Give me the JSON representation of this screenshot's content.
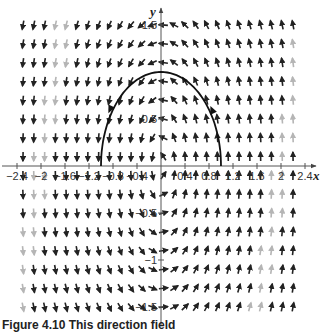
{
  "chart_data": {
    "type": "direction_field",
    "title": "",
    "xlabel": "x",
    "ylabel": "y",
    "xlim": [
      -2.6,
      2.6
    ],
    "ylim": [
      -1.6,
      1.6
    ],
    "x_ticks": [
      -2.4,
      -2,
      -1.6,
      -1.2,
      -0.8,
      -0.4,
      0.4,
      0.8,
      1.2,
      1.6,
      2,
      2.4
    ],
    "x_tick_labels": [
      "−2.4",
      "−2",
      "−1.6",
      "−1.2",
      "−0.8",
      "−0.4",
      "0.4",
      "0.8",
      "1.2",
      "1.6",
      "2",
      "2.4"
    ],
    "y_ticks": [
      1.5,
      1,
      0.5,
      -0.5,
      -1,
      -1.5
    ],
    "y_tick_labels": [
      "1.5",
      "",
      "0.5",
      "−0.5",
      "−1",
      "−1.5"
    ],
    "grid": false,
    "field": {
      "x_step": 0.18,
      "y_step": 0.2,
      "x_range": [
        -2.3,
        2.3
      ],
      "y_range": [
        -1.5,
        1.5
      ],
      "description": "counterclockwise rotational flow: arrows point left above the x-axis near x=0, up for x>0, down for x<0, right below the x-axis"
    },
    "solution_curve": {
      "description": "arch from (-1, 0) through (0, 1) to (1, 0), traversed counterclockwise",
      "points": [
        [
          -1,
          0
        ],
        [
          -0.9,
          0.44
        ],
        [
          -0.7,
          0.71
        ],
        [
          -0.5,
          0.87
        ],
        [
          -0.3,
          0.95
        ],
        [
          0,
          1
        ],
        [
          0.3,
          0.95
        ],
        [
          0.5,
          0.87
        ],
        [
          0.7,
          0.71
        ],
        [
          0.9,
          0.44
        ],
        [
          1,
          0
        ]
      ],
      "arrow_markers": [
        [
          -0.85,
          0.6
        ],
        [
          0.85,
          0.6
        ]
      ]
    }
  },
  "caption": "Figure 4.10  This direction field"
}
